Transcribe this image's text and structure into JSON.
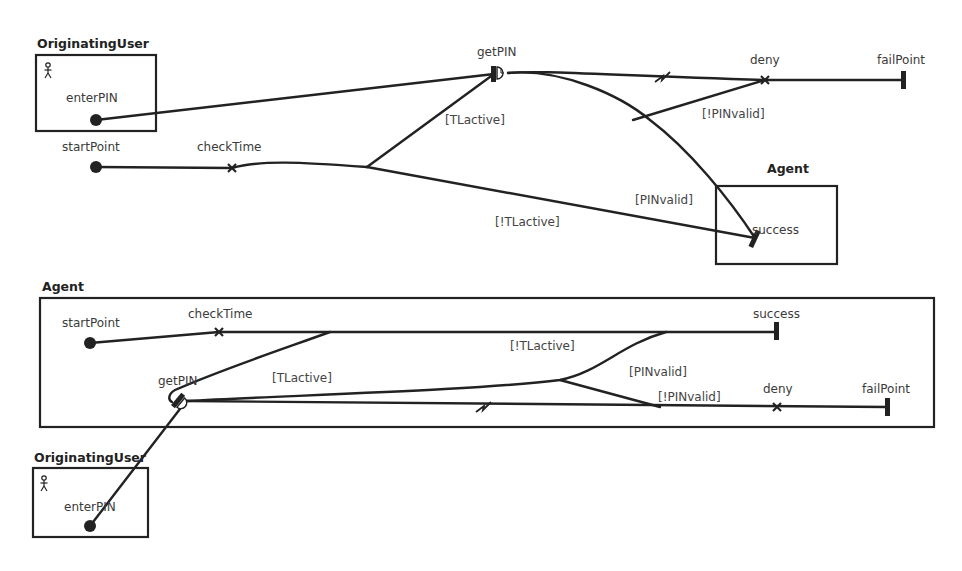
{
  "top_diagram": {
    "components": {
      "originating_user": {
        "title": "OriginatingUser",
        "icon": "actor-icon"
      },
      "agent": {
        "title": "Agent"
      }
    },
    "responsibilities": {
      "enterPIN": "enterPIN",
      "startPoint": "startPoint",
      "checkTime": "checkTime",
      "getPIN": "getPIN",
      "deny": "deny",
      "failPoint": "failPoint",
      "success": "success"
    },
    "guards": {
      "tl_active": "[TLactive]",
      "not_tl_active": "[!TLactive]",
      "pin_valid": "[PINvalid]",
      "not_pin_valid": "[!PINvalid]"
    }
  },
  "bottom_diagram": {
    "components": {
      "agent": {
        "title": "Agent"
      },
      "originating_user": {
        "title": "OriginatingUser",
        "icon": "actor-icon"
      }
    },
    "responsibilities": {
      "startPoint": "startPoint",
      "checkTime": "checkTime",
      "success": "success",
      "getPIN": "getPIN",
      "deny": "deny",
      "failPoint": "failPoint",
      "enterPIN": "enterPIN"
    },
    "guards": {
      "tl_active": "[TLactive]",
      "not_tl_active": "[!TLactive]",
      "pin_valid": "[PINvalid]",
      "not_pin_valid": "[!PINvalid]"
    }
  },
  "colors": {
    "ink": "#222222",
    "label": "#3a3a3a",
    "background": "#ffffff"
  }
}
